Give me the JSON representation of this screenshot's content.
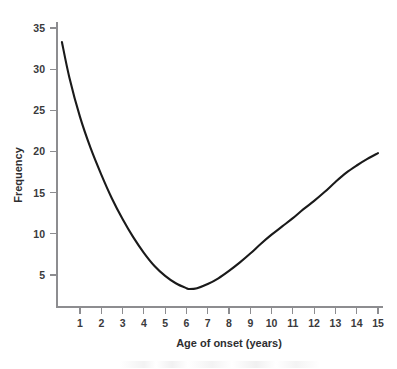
{
  "chart_data": {
    "type": "line",
    "title": "",
    "subtitle": "",
    "xlabel": "Age of onset (years)",
    "ylabel": "Frequency",
    "xlim": [
      0.15,
      15
    ],
    "ylim": [
      0,
      35
    ],
    "xticks": [
      1,
      2,
      3,
      4,
      5,
      6,
      7,
      8,
      9,
      10,
      11,
      12,
      13,
      14,
      15
    ],
    "xtick_labels": [
      "1",
      "2",
      "3",
      "4",
      "5",
      "6",
      "7",
      "8",
      "9",
      "10",
      "11",
      "12",
      "13",
      "14",
      "15"
    ],
    "yticks": [
      5,
      10,
      15,
      20,
      25,
      30,
      35
    ],
    "ytick_labels": [
      "5",
      "10",
      "15",
      "20",
      "25",
      "30",
      "35"
    ],
    "grid": false,
    "legend": null,
    "annotations": [],
    "line_color": "#1a1a1a",
    "axis_color": "#8d8d90",
    "background_color": "#ffffff",
    "series": [
      {
        "name": "Frequency of onset",
        "x": [
          0.15,
          0.5,
          1.0,
          1.5,
          2.0,
          2.5,
          3.0,
          3.5,
          4.0,
          4.5,
          5.0,
          5.5,
          6.0,
          6.15,
          6.5,
          7.0,
          7.5,
          8.0,
          8.5,
          9.0,
          9.5,
          10.0,
          10.5,
          11.0,
          11.5,
          12.0,
          12.5,
          13.0,
          13.5,
          14.0,
          14.5,
          15.0
        ],
        "y": [
          33.3,
          29.0,
          24.2,
          20.4,
          17.2,
          14.3,
          11.8,
          9.6,
          7.7,
          6.1,
          4.9,
          4.0,
          3.4,
          3.3,
          3.4,
          3.9,
          4.6,
          5.5,
          6.5,
          7.6,
          8.8,
          9.9,
          10.9,
          11.9,
          13.0,
          14.0,
          15.1,
          16.3,
          17.4,
          18.3,
          19.1,
          19.8
        ]
      }
    ],
    "minimum_point": {
      "x": 6.15,
      "y": 3.3
    },
    "start_point": {
      "x": 0.15,
      "y": 33.3
    },
    "end_point": {
      "x": 15.0,
      "y": 19.8
    }
  }
}
